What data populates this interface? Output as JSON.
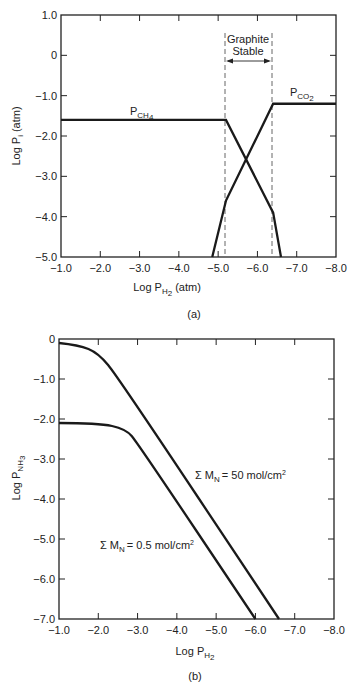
{
  "chart_data": [
    {
      "id": "a",
      "type": "line",
      "caption": "(a)",
      "xlabel": "Log P_H2 (atm)",
      "ylabel": "Log P_i (atm)",
      "xlim": [
        -1.0,
        -8.0
      ],
      "ylim": [
        -5.0,
        1.0
      ],
      "x_ticks": [
        "-1.0",
        "-2.0",
        "-3.0",
        "-4.0",
        "-5.0",
        "-6.0",
        "-7.0",
        "-8.0"
      ],
      "y_ticks": [
        "1.0",
        "0",
        "-1.0",
        "-2.0",
        "-3.0",
        "-4.0",
        "-5.0"
      ],
      "region": {
        "label_line1": "Graphite",
        "label_line2": "Stable",
        "x_start": -5.2,
        "x_end": -6.4
      },
      "series": [
        {
          "name": "P_CH4",
          "x": [
            -1.0,
            -5.2,
            -6.4,
            -6.6
          ],
          "y": [
            -1.6,
            -1.6,
            -3.9,
            -5.0
          ]
        },
        {
          "name": "P_CO2",
          "x": [
            -4.85,
            -5.2,
            -6.4,
            -8.0
          ],
          "y": [
            -5.0,
            -3.6,
            -1.2,
            -1.2
          ]
        }
      ],
      "grid": false
    },
    {
      "id": "b",
      "type": "line",
      "caption": "(b)",
      "xlabel": "Log P_H2",
      "ylabel": "Log P_NH3",
      "xlim": [
        -1.0,
        -8.0
      ],
      "ylim": [
        -7.0,
        0
      ],
      "x_ticks": [
        "-1.0",
        "-2.0",
        "-3.0",
        "-4.0",
        "-5.0",
        "-6.0",
        "-7.0",
        "-8.0"
      ],
      "y_ticks": [
        "0",
        "-1.0",
        "-2.0",
        "-3.0",
        "-4.0",
        "-5.0",
        "-6.0",
        "-7.0"
      ],
      "series": [
        {
          "name": "Σ M_N = 50 mol/cm²",
          "x": [
            -1.0,
            -1.5,
            -2.0,
            -2.5,
            -6.6
          ],
          "y": [
            -0.1,
            -0.15,
            -0.35,
            -0.95,
            -7.0
          ]
        },
        {
          "name": "Σ M_N = 0.5 mol/cm²",
          "x": [
            -1.0,
            -2.0,
            -2.7,
            -3.0,
            -6.0
          ],
          "y": [
            -2.1,
            -2.1,
            -2.25,
            -2.6,
            -7.0
          ]
        }
      ],
      "grid": false
    }
  ],
  "labels": {
    "a": {
      "ch4_main": "P",
      "ch4_sub": "CH",
      "ch4_subsub": "4",
      "co2_main": "P",
      "co2_sub": "CO",
      "co2_subsub": "2",
      "region1": "Graphite",
      "region2": "Stable",
      "xlabel_main": "Log P",
      "xlabel_sub": "H",
      "xlabel_subsub": "2",
      "xlabel_tail": "(atm)",
      "ylabel": "Log P",
      "ylabel_sub": "i",
      "ylabel_tail": "(atm)",
      "caption": "(a)"
    },
    "b": {
      "s1_pre": "Σ M",
      "s1_sub": "N",
      "s1_post": "= 50 mol/cm",
      "s1_sup": "2",
      "s2_pre": "Σ M",
      "s2_sub": "N",
      "s2_post": "= 0.5 mol/cm",
      "s2_sup": "2",
      "xlabel_main": "Log P",
      "xlabel_sub": "H",
      "xlabel_subsub": "2",
      "ylabel": "Log P",
      "ylabel_sub": "NH",
      "ylabel_subsub": "3",
      "caption": "(b)"
    }
  }
}
